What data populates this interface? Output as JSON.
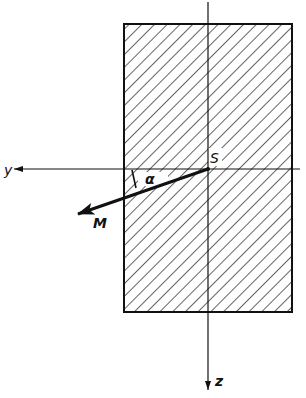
{
  "diagram": {
    "type": "cross-section-bending-moment",
    "colors": {
      "ink": "#111111",
      "background": "#ffffff"
    },
    "labels": {
      "y_axis": "y",
      "z_axis": "z",
      "centroid": "S",
      "moment": "M",
      "angle": "α"
    },
    "geometry": {
      "rect": {
        "x": 124,
        "y": 24,
        "width": 168,
        "height": 288
      },
      "centroid": {
        "x": 208,
        "y": 169
      },
      "moment_tip": {
        "x": 78,
        "y": 214
      }
    }
  }
}
